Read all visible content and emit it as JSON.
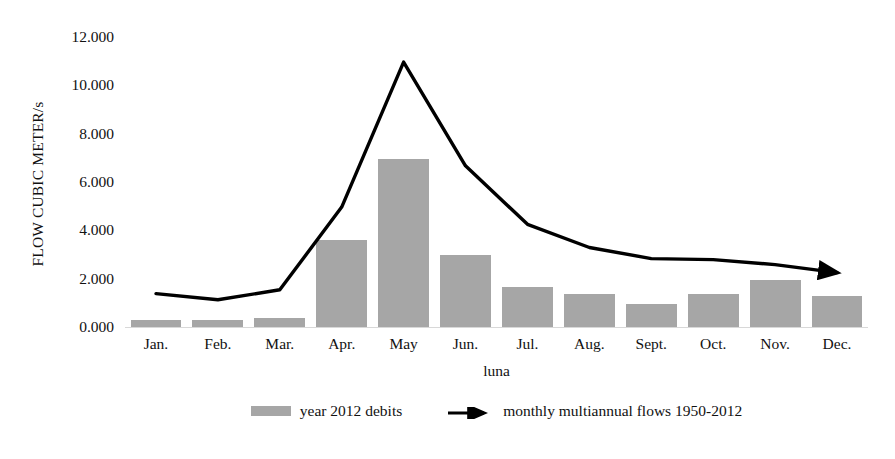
{
  "chart_data": {
    "type": "bar",
    "title": "",
    "xlabel": "luna",
    "ylabel": "FLOW CUBIC METER/s",
    "categories": [
      "Jan.",
      "Feb.",
      "Mar.",
      "Apr.",
      "May",
      "Jun.",
      "Jul.",
      "Aug.",
      "Sept.",
      "Oct.",
      "Nov.",
      "Dec."
    ],
    "ylim": [
      0,
      12
    ],
    "ytick_step": 2,
    "ytick_labels": [
      "12.000",
      "10.000",
      "8.000",
      "6.000",
      "4.000",
      "2.000",
      "0.000"
    ],
    "ytick_values": [
      12,
      10,
      8,
      6,
      4,
      2,
      0
    ],
    "grid": false,
    "legend_position": "bottom",
    "series": [
      {
        "name": "year 2012 debits",
        "type": "bar",
        "color": "#a6a6a6",
        "values": [
          0.28,
          0.28,
          0.38,
          3.62,
          6.96,
          2.96,
          1.67,
          1.38,
          0.96,
          1.38,
          1.96,
          1.29
        ]
      },
      {
        "name": "monthly multiannual flows 1950-2012",
        "type": "line",
        "color": "#000000",
        "values": [
          1.38,
          1.13,
          1.54,
          4.96,
          10.96,
          6.67,
          4.25,
          3.29,
          2.83,
          2.79,
          2.58,
          2.25
        ]
      }
    ]
  },
  "legend": {
    "items": [
      {
        "label": "year 2012 debits",
        "marker": "bar-swatch"
      },
      {
        "label": "monthly multiannual flows 1950-2012",
        "marker": "arrow-line"
      }
    ]
  },
  "colors": {
    "bar": "#a6a6a6",
    "line": "#000000",
    "text": "#111111",
    "background": "#ffffff"
  }
}
